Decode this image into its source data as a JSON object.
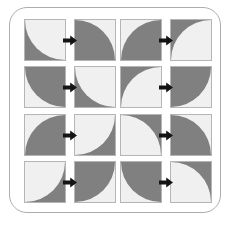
{
  "figure": {
    "colors": {
      "dark": "#808080",
      "light": "#f0f0f0",
      "tile_border": "#b5b5b5",
      "panel_border": "#adadad",
      "arrow": "#141414",
      "background": "#ffffff"
    },
    "arrow_glyph": "right-arrow",
    "tile_size_px": 42
  },
  "quadrants": [
    {
      "name": "top-left",
      "pairs": [
        {
          "label": "pair-1",
          "before": {
            "background": "dark",
            "wedge": "light",
            "corner": "top-right"
          },
          "after": {
            "background": "light",
            "wedge": "dark",
            "corner": "bottom-left"
          }
        },
        {
          "label": "pair-2",
          "before": {
            "background": "light",
            "wedge": "dark",
            "corner": "top-right"
          },
          "after": {
            "background": "dark",
            "wedge": "light",
            "corner": "top-right"
          }
        }
      ]
    },
    {
      "name": "top-right",
      "pairs": [
        {
          "label": "pair-3",
          "before": {
            "background": "light",
            "wedge": "dark",
            "corner": "bottom-right"
          },
          "after": {
            "background": "dark",
            "wedge": "light",
            "corner": "bottom-right"
          }
        },
        {
          "label": "pair-4",
          "before": {
            "background": "dark",
            "wedge": "light",
            "corner": "bottom-right"
          },
          "after": {
            "background": "light",
            "wedge": "dark",
            "corner": "top-left"
          }
        }
      ]
    },
    {
      "name": "bottom-left",
      "pairs": [
        {
          "label": "pair-5",
          "before": {
            "background": "light",
            "wedge": "dark",
            "corner": "bottom-right"
          },
          "after": {
            "background": "dark",
            "wedge": "light",
            "corner": "top-left"
          }
        },
        {
          "label": "pair-6",
          "before": {
            "background": "dark",
            "wedge": "light",
            "corner": "top-left"
          },
          "after": {
            "background": "light",
            "wedge": "dark",
            "corner": "top-left"
          }
        }
      ]
    },
    {
      "name": "bottom-right",
      "pairs": [
        {
          "label": "pair-7",
          "before": {
            "background": "dark",
            "wedge": "light",
            "corner": "bottom-left"
          },
          "after": {
            "background": "light",
            "wedge": "dark",
            "corner": "bottom-left"
          }
        },
        {
          "label": "pair-8",
          "before": {
            "background": "light",
            "wedge": "dark",
            "corner": "top-right"
          },
          "after": {
            "background": "dark",
            "wedge": "light",
            "corner": "bottom-left"
          }
        }
      ]
    }
  ]
}
